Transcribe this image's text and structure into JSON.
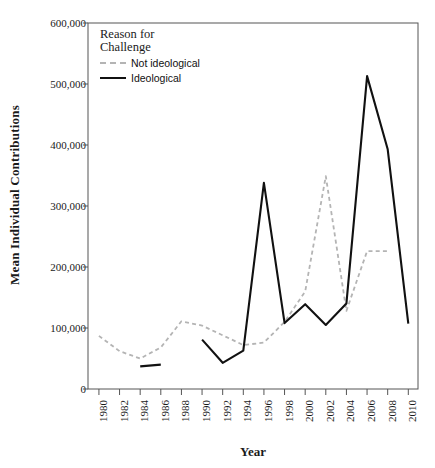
{
  "chart_data": {
    "type": "line",
    "title": "",
    "xlabel": "Year",
    "ylabel": "Mean Individual Contributions",
    "x": [
      1980,
      1982,
      1984,
      1986,
      1988,
      1990,
      1992,
      1994,
      1996,
      1998,
      2000,
      2002,
      2004,
      2006,
      2008,
      2010
    ],
    "xtick_labels": [
      "1980",
      "1982",
      "1984",
      "1986",
      "1988",
      "1990",
      "1992",
      "1994",
      "1996",
      "1998",
      "2000",
      "2002",
      "2004",
      "2006",
      "2008",
      "2010"
    ],
    "ytick_labels": [
      "0",
      "100,000",
      "200,000",
      "300,000",
      "400,000",
      "500,000",
      "600,000"
    ],
    "ytick_values": [
      0,
      100000,
      200000,
      300000,
      400000,
      500000,
      600000
    ],
    "xlim": [
      1980,
      2010
    ],
    "ylim": [
      0,
      600000
    ],
    "grid": false,
    "legend_position": "top-left-inside",
    "legend_title": "Reason for Challenge",
    "series": [
      {
        "name": "Not ideological",
        "style": "dashed",
        "color": "#b4b4b4",
        "values": [
          87000,
          62000,
          50000,
          68000,
          111000,
          104000,
          88000,
          72000,
          76000,
          110000,
          160000,
          349000,
          128000,
          226000,
          226000,
          null
        ]
      },
      {
        "name": "Ideological",
        "style": "solid",
        "color": "#111111",
        "values": [
          null,
          null,
          37000,
          40000,
          null,
          81000,
          43000,
          63000,
          338000,
          108000,
          139000,
          105000,
          140000,
          513000,
          393000,
          107000
        ]
      }
    ]
  },
  "legend": {
    "title_line1": "Reason for",
    "title_line2": "Challenge",
    "items": [
      {
        "label": "Not ideological"
      },
      {
        "label": "Ideological"
      }
    ]
  },
  "axes": {
    "x_title": "Year",
    "y_title": "Mean Individual Contributions"
  }
}
